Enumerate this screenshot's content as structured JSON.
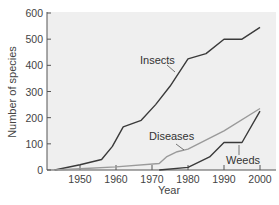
{
  "chart_data": {
    "type": "line",
    "title": "",
    "xlabel": "Year",
    "ylabel": "Number of species",
    "xlim": [
      1941,
      2004
    ],
    "ylim": [
      0,
      600
    ],
    "x_ticks": [
      1950,
      1960,
      1970,
      1980,
      1990,
      2000
    ],
    "y_ticks": [
      0,
      100,
      200,
      300,
      400,
      500,
      600
    ],
    "grid": false,
    "legend": "inline labels",
    "series": [
      {
        "name": "Insects",
        "color": "#3a3a3a",
        "points": [
          [
            1943,
            0
          ],
          [
            1950,
            20
          ],
          [
            1956,
            40
          ],
          [
            1959,
            90
          ],
          [
            1962,
            165
          ],
          [
            1967,
            190
          ],
          [
            1971,
            250
          ],
          [
            1975,
            320
          ],
          [
            1980,
            425
          ],
          [
            1985,
            445
          ],
          [
            1990,
            500
          ],
          [
            1995,
            500
          ],
          [
            2000,
            545
          ]
        ]
      },
      {
        "name": "Diseases",
        "color": "#9a9a9a",
        "points": [
          [
            1943,
            0
          ],
          [
            1950,
            5
          ],
          [
            1960,
            12
          ],
          [
            1972,
            25
          ],
          [
            1974,
            50
          ],
          [
            1977,
            70
          ],
          [
            1980,
            80
          ],
          [
            1990,
            150
          ],
          [
            2000,
            235
          ]
        ]
      },
      {
        "name": "Weeds",
        "color": "#3a3a3a",
        "points": [
          [
            1972,
            0
          ],
          [
            1980,
            10
          ],
          [
            1986,
            50
          ],
          [
            1990,
            105
          ],
          [
            1995,
            105
          ],
          [
            2000,
            225
          ]
        ]
      }
    ],
    "annotations": [
      {
        "text": "Insects",
        "series": "Insects"
      },
      {
        "text": "Diseases",
        "series": "Diseases"
      },
      {
        "text": "Weeds",
        "series": "Weeds"
      }
    ]
  }
}
